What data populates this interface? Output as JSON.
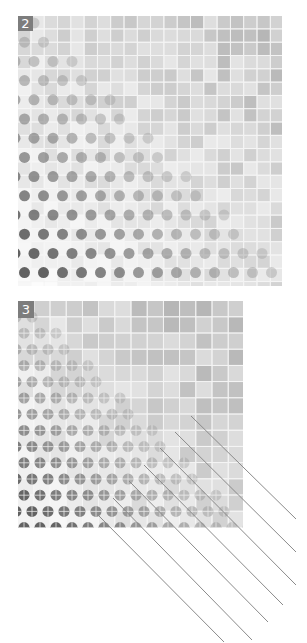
{
  "figure": {
    "background": "#ffffff",
    "panels": [
      {
        "id": "panel-2",
        "label": "2",
        "x": 18,
        "y": 16,
        "width": 264,
        "height": 270,
        "cols": 20,
        "rows": 20,
        "cell": 13.3,
        "label_size": [
          15,
          15
        ],
        "seed": 17,
        "circle": {
          "diameter": 11,
          "spacing_x": 19,
          "spacing_y": 19.2,
          "offset_x": -3,
          "offset_y": 7,
          "cross": false
        },
        "gradient": "bottom-left dots dark, fading toward top-right; top-right light gray tiles"
      },
      {
        "id": "panel-3",
        "label": "3",
        "x": 18,
        "y": 301,
        "width": 225,
        "height": 227,
        "cols": 14,
        "rows": 14,
        "cell": 16.2,
        "label_size": [
          16,
          17
        ],
        "seed": 43,
        "circle": {
          "diameter": 11,
          "spacing_x": 16,
          "spacing_y": 16.2,
          "offset_x": -2,
          "offset_y": 16,
          "cross": true
        },
        "gradient": "bottom-left dots dark, fading toward top-right; top-right medium gray tiles"
      }
    ],
    "lines": {
      "color": "#8a8a8a",
      "width": 1,
      "segments": [
        {
          "x1": 191,
          "y1": 416,
          "x2": 296,
          "y2": 519
        },
        {
          "x1": 175,
          "y1": 432,
          "x2": 296,
          "y2": 552
        },
        {
          "x1": 160,
          "y1": 448,
          "x2": 296,
          "y2": 585
        },
        {
          "x1": 144,
          "y1": 465,
          "x2": 283,
          "y2": 605
        },
        {
          "x1": 129,
          "y1": 481,
          "x2": 268,
          "y2": 622
        },
        {
          "x1": 113,
          "y1": 498,
          "x2": 252,
          "y2": 640
        },
        {
          "x1": 97,
          "y1": 514,
          "x2": 224,
          "y2": 642
        }
      ]
    }
  }
}
